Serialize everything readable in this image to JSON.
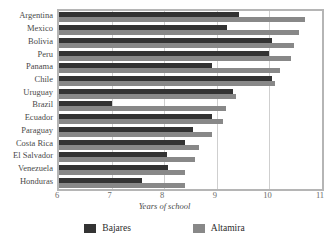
{
  "chart_data": {
    "type": "bar",
    "orientation": "horizontal",
    "title": "",
    "xlabel": "Years of school",
    "ylabel": "",
    "xlim": [
      6,
      11
    ],
    "xticks": [
      6,
      7,
      8,
      9,
      10,
      11
    ],
    "grid": true,
    "legend_position": "bottom",
    "categories": [
      "Argentina",
      "Mexico",
      "Bolivia",
      "Peru",
      "Panama",
      "Chile",
      "Uruguay",
      "Brazil",
      "Ecuador",
      "Paraguay",
      "Costa Rica",
      "El Salvador",
      "Venezuela",
      "Honduras"
    ],
    "series": [
      {
        "name": "Bajares",
        "color": "#333333",
        "values": [
          9.42,
          9.2,
          10.05,
          10.0,
          8.9,
          10.05,
          9.3,
          7.0,
          8.9,
          8.55,
          8.4,
          8.06,
          8.07,
          7.57
        ]
      },
      {
        "name": "Altamira",
        "color": "#888888",
        "values": [
          10.68,
          10.56,
          10.47,
          10.42,
          10.2,
          10.1,
          9.37,
          9.18,
          9.12,
          8.9,
          8.66,
          8.58,
          8.4,
          8.4
        ]
      }
    ]
  },
  "colors": {
    "bajares": "#333333",
    "altamira": "#888888",
    "plot_border": "#b5b5b5",
    "gridline": "#cfcfcf",
    "label_text": "#4a4a4a",
    "tick_text": "#6a6a6a",
    "background": "#ffffff"
  }
}
